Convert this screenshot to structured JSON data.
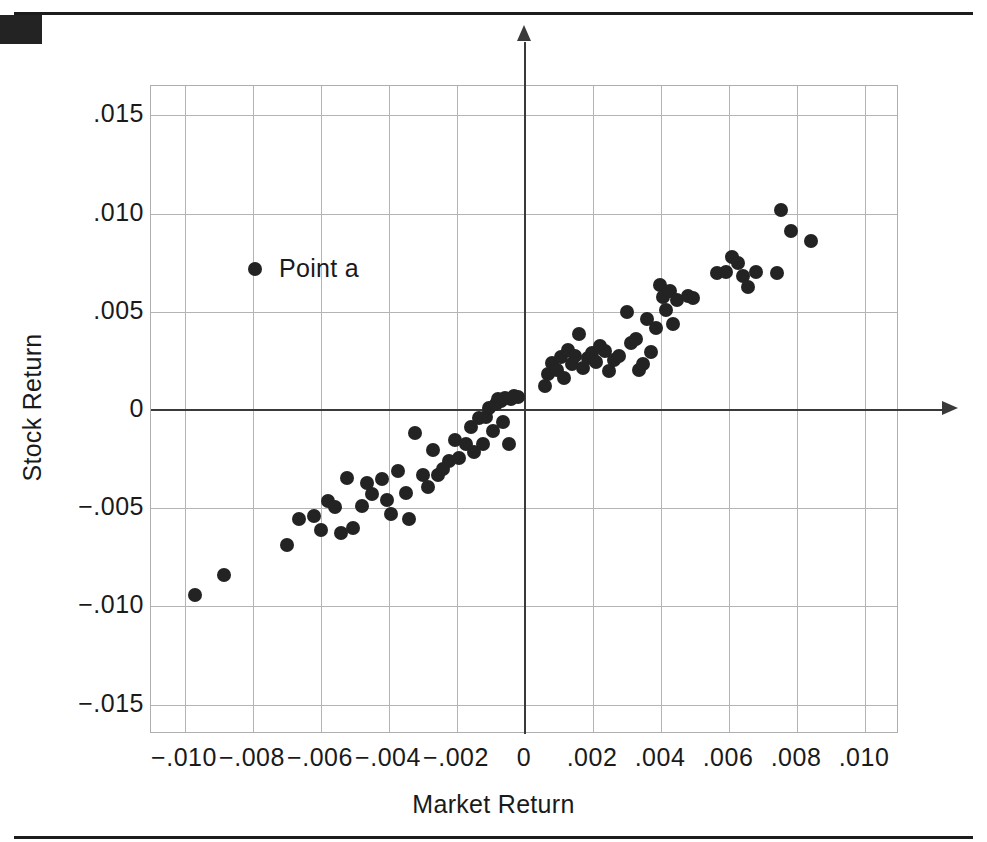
{
  "figure": {
    "decorations": {
      "top_rule": "horizontal-rule",
      "bottom_rule": "horizontal-rule",
      "corner_block": "black-corner-block"
    }
  },
  "legend": {
    "position": "inside-upper-left",
    "marker": "filled-circle",
    "entries": [
      {
        "label": "Point a",
        "color": "#232323",
        "marker": "circle"
      }
    ]
  },
  "colors": {
    "marker": "#232323",
    "gridline": "#b4b4b4",
    "zero_axis": "#3a3a3a",
    "frame": "#aeaeae",
    "text": "#1a1a1a",
    "background": "#ffffff"
  },
  "chart_data": {
    "type": "scatter",
    "title": "",
    "xlabel": "Market Return",
    "ylabel": "Stock Return",
    "xlim": [
      -0.011,
      0.011
    ],
    "ylim": [
      -0.0165,
      0.0165
    ],
    "xticks": [
      -0.01,
      -0.008,
      -0.006,
      -0.004,
      -0.002,
      0,
      0.002,
      0.004,
      0.006,
      0.008,
      0.01
    ],
    "yticks": [
      0.015,
      0.01,
      0.005,
      0,
      -0.005,
      -0.01,
      -0.015
    ],
    "xticklabels": [
      "−.010",
      "−.008",
      "−.006",
      "−.004",
      "−.002",
      "0",
      ".002",
      ".004",
      ".006",
      ".008",
      ".010"
    ],
    "yticklabels": [
      ".015",
      ".010",
      ".005",
      "0",
      "−.005",
      "−.010",
      "−.015"
    ],
    "grid": true,
    "zero_axes": true,
    "axis_arrows": [
      "up",
      "right"
    ],
    "legend_position": "upper-left-inside",
    "marker_size_px": 14,
    "series": [
      {
        "name": "Point a",
        "color": "#232323",
        "points": [
          [
            -0.0097,
            -0.0094
          ],
          [
            -0.00885,
            -0.0084
          ],
          [
            -0.007,
            -0.00685
          ],
          [
            -0.00665,
            -0.00555
          ],
          [
            -0.0062,
            -0.0054
          ],
          [
            -0.006,
            -0.0061
          ],
          [
            -0.0058,
            -0.00465
          ],
          [
            -0.0056,
            -0.00495
          ],
          [
            -0.0054,
            -0.00625
          ],
          [
            -0.00525,
            -0.00345
          ],
          [
            -0.00505,
            -0.006
          ],
          [
            -0.0048,
            -0.0049
          ],
          [
            -0.00465,
            -0.0037
          ],
          [
            -0.0045,
            -0.0043
          ],
          [
            -0.0042,
            -0.0035
          ],
          [
            -0.00405,
            -0.0046
          ],
          [
            -0.00395,
            -0.0053
          ],
          [
            -0.00375,
            -0.0031
          ],
          [
            -0.0035,
            -0.00425
          ],
          [
            -0.0034,
            -0.00555
          ],
          [
            -0.00325,
            -0.00115
          ],
          [
            -0.003,
            -0.0033
          ],
          [
            -0.00285,
            -0.0039
          ],
          [
            -0.0027,
            -0.00205
          ],
          [
            -0.00255,
            -0.0033
          ],
          [
            -0.0024,
            -0.003
          ],
          [
            -0.00225,
            -0.0026
          ],
          [
            -0.00205,
            -0.00155
          ],
          [
            -0.00195,
            -0.00245
          ],
          [
            -0.00175,
            -0.00175
          ],
          [
            -0.0016,
            -0.00085
          ],
          [
            -0.0015,
            -0.00215
          ],
          [
            -0.00135,
            -0.0004
          ],
          [
            -0.00125,
            -0.00175
          ],
          [
            -0.00115,
            -0.00035
          ],
          [
            -0.00105,
            0.0001
          ],
          [
            -0.00095,
            -0.00105
          ],
          [
            -0.00085,
            0.0003
          ],
          [
            -0.0008,
            0.00055
          ],
          [
            -0.0007,
            0.00045
          ],
          [
            -0.00065,
            -0.0006
          ],
          [
            -0.00058,
            0.0006
          ],
          [
            -0.00048,
            -0.00175
          ],
          [
            -0.0004,
            0.00055
          ],
          [
            -0.00032,
            0.0007
          ],
          [
            -0.00022,
            0.00065
          ],
          [
            0.0006,
            0.0012
          ],
          [
            0.00068,
            0.00185
          ],
          [
            0.0008,
            0.0024
          ],
          [
            0.00095,
            0.00205
          ],
          [
            0.00105,
            0.0027
          ],
          [
            0.00115,
            0.00165
          ],
          [
            0.00125,
            0.00305
          ],
          [
            0.00138,
            0.00235
          ],
          [
            0.00148,
            0.00275
          ],
          [
            0.0016,
            0.00385
          ],
          [
            0.00172,
            0.00215
          ],
          [
            0.00185,
            0.00265
          ],
          [
            0.00198,
            0.0029
          ],
          [
            0.0021,
            0.00245
          ],
          [
            0.00222,
            0.00325
          ],
          [
            0.00235,
            0.003
          ],
          [
            0.00248,
            0.002
          ],
          [
            0.00262,
            0.00255
          ],
          [
            0.00275,
            0.00275
          ],
          [
            0.003,
            0.005
          ],
          [
            0.00312,
            0.0034
          ],
          [
            0.00325,
            0.0036
          ],
          [
            0.00335,
            0.00205
          ],
          [
            0.00348,
            0.00235
          ],
          [
            0.0036,
            0.00465
          ],
          [
            0.00372,
            0.00295
          ],
          [
            0.00385,
            0.0042
          ],
          [
            0.00398,
            0.00635
          ],
          [
            0.00405,
            0.00575
          ],
          [
            0.00415,
            0.0051
          ],
          [
            0.00425,
            0.00605
          ],
          [
            0.00435,
            0.0044
          ],
          [
            0.00448,
            0.0056
          ],
          [
            0.00478,
            0.0058
          ],
          [
            0.00495,
            0.0057
          ],
          [
            0.00565,
            0.007
          ],
          [
            0.00592,
            0.00705
          ],
          [
            0.0061,
            0.0078
          ],
          [
            0.00625,
            0.0075
          ],
          [
            0.0064,
            0.0068
          ],
          [
            0.00655,
            0.00625
          ],
          [
            0.00678,
            0.00705
          ],
          [
            0.0074,
            0.007
          ],
          [
            0.00752,
            0.0102
          ],
          [
            0.00782,
            0.0091
          ],
          [
            0.0084,
            0.0086
          ]
        ]
      }
    ]
  }
}
